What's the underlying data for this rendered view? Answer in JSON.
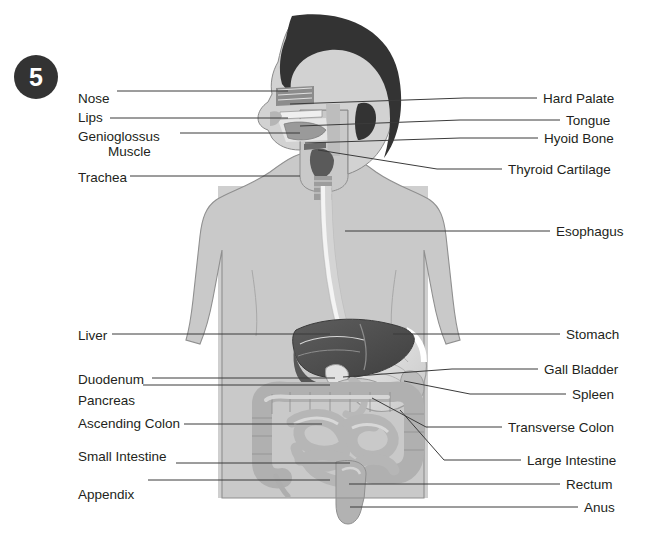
{
  "figure": {
    "number": "5",
    "badge_color": "#333333",
    "background": "#ffffff",
    "title_present": false
  },
  "palette": {
    "hair": "#333333",
    "skin": "#c9c9c9",
    "torso_band": "#cfcfcf",
    "liver_dark": "#4a4a4a",
    "liver_mid": "#6e6e6e",
    "stomach_light": "#dcdcdc",
    "intestine": "#b3b3b3",
    "esophagus": "#e4e4e4",
    "leader_line": "#3b3b3b",
    "text": "#231f20"
  },
  "labels_left": [
    {
      "id": "nose",
      "text": "Nose",
      "x": 78,
      "y": 91,
      "line_from": 117,
      "line_to": 288,
      "target_y": 91
    },
    {
      "id": "lips",
      "text": "Lips",
      "x": 78,
      "y": 110,
      "line_from": 110,
      "line_to": 288,
      "target_y": 118
    },
    {
      "id": "genioglossus",
      "text": "Genioglossus",
      "text2": "Muscle",
      "x": 78,
      "y": 129,
      "line_from": 180,
      "line_to": 300,
      "target_y": 133
    },
    {
      "id": "trachea",
      "text": "Trachea",
      "x": 78,
      "y": 170,
      "line_from": 130,
      "line_to": 300,
      "target_y": 176
    },
    {
      "id": "liver",
      "text": "Liver",
      "x": 78,
      "y": 328,
      "line_from": 112,
      "line_to": 330,
      "target_y": 334
    },
    {
      "id": "duodenum",
      "text": "Duodenum",
      "x": 78,
      "y": 372,
      "line_from": 152,
      "line_to": 335,
      "target_y": 378
    },
    {
      "id": "pancreas",
      "text": "Pancreas",
      "x": 78,
      "y": 393,
      "line_from": 143,
      "line_to": 330,
      "target_y": 385
    },
    {
      "id": "ascending-colon",
      "text": "Ascending Colon",
      "x": 78,
      "y": 416,
      "line_from": 184,
      "line_to": 322,
      "target_y": 424
    },
    {
      "id": "small-intestine",
      "text": "Small Intestine",
      "x": 78,
      "y": 449,
      "line_from": 176,
      "line_to": 350,
      "target_y": 463
    },
    {
      "id": "appendix",
      "text": "Appendix",
      "x": 78,
      "y": 487,
      "line_from": 148,
      "line_to": 330,
      "target_y": 480
    }
  ],
  "labels_right": [
    {
      "id": "hard-palate",
      "text": "Hard Palate",
      "x": 543,
      "y": 91,
      "line_from": 464,
      "line_to": 537,
      "target_y": 98,
      "origin_x": 290,
      "origin_y": 104
    },
    {
      "id": "tongue",
      "text": "Tongue",
      "x": 566,
      "y": 113,
      "line_from": 460,
      "line_to": 560,
      "target_y": 120,
      "origin_x": 300,
      "origin_y": 126
    },
    {
      "id": "hyoid-bone",
      "text": "Hyoid Bone",
      "x": 544,
      "y": 131,
      "line_from": 460,
      "line_to": 538,
      "target_y": 138,
      "origin_x": 305,
      "origin_y": 143
    },
    {
      "id": "thyroid-cartilage",
      "text": "Thyroid Cartilage",
      "x": 508,
      "y": 162,
      "line_from": 437,
      "line_to": 502,
      "target_y": 169,
      "origin_x": 318,
      "origin_y": 150
    },
    {
      "id": "esophagus",
      "text": "Esophagus",
      "x": 556,
      "y": 224,
      "line_from": 472,
      "line_to": 550,
      "target_y": 231,
      "origin_x": 345,
      "origin_y": 231
    },
    {
      "id": "stomach",
      "text": "Stomach",
      "x": 566,
      "y": 327,
      "line_from": 475,
      "line_to": 560,
      "target_y": 334,
      "origin_x": 393,
      "origin_y": 334
    },
    {
      "id": "gall-bladder",
      "text": "Gall Bladder",
      "x": 544,
      "y": 362,
      "line_from": 452,
      "line_to": 538,
      "target_y": 369,
      "origin_x": 343,
      "origin_y": 377
    },
    {
      "id": "spleen",
      "text": "Spleen",
      "x": 572,
      "y": 387,
      "line_from": 470,
      "line_to": 566,
      "target_y": 394,
      "origin_x": 404,
      "origin_y": 381
    },
    {
      "id": "transverse-colon",
      "text": "Transverse Colon",
      "x": 508,
      "y": 420,
      "line_from": 426,
      "line_to": 502,
      "target_y": 427,
      "origin_x": 372,
      "origin_y": 398
    },
    {
      "id": "large-intestine",
      "text": "Large Intestine",
      "x": 527,
      "y": 453,
      "line_from": 444,
      "line_to": 521,
      "target_y": 460,
      "origin_x": 400,
      "origin_y": 410
    },
    {
      "id": "rectum",
      "text": "Rectum",
      "x": 566,
      "y": 477,
      "line_from": 440,
      "line_to": 560,
      "target_y": 484,
      "origin_x": 349,
      "origin_y": 484
    },
    {
      "id": "anus",
      "text": "Anus",
      "x": 584,
      "y": 500,
      "line_from": 440,
      "line_to": 578,
      "target_y": 507,
      "origin_x": 350,
      "origin_y": 507
    }
  ],
  "badge_position": {
    "x": 14,
    "y": 55
  }
}
